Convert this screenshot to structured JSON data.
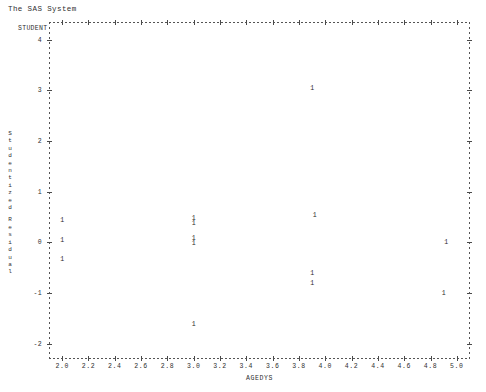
{
  "window": {
    "title": "The SAS System"
  },
  "plot": {
    "corner_label": "STUDENT",
    "point_marker": "1"
  },
  "chart_data": {
    "type": "scatter",
    "title": "The SAS System",
    "xlabel": "AGEDYS",
    "ylabel": "Studentized Residual",
    "ylabel_lines": [
      "S",
      "t",
      "u",
      "d",
      "e",
      "n",
      "t",
      "i",
      "z",
      "e",
      "d",
      "R",
      "e",
      "s",
      "i",
      "d",
      "u",
      "a",
      "l"
    ],
    "xlim": [
      1.9,
      5.1
    ],
    "ylim": [
      -2.3,
      4.35
    ],
    "xticks": [
      2.0,
      2.2,
      2.4,
      2.6,
      2.8,
      3.0,
      3.2,
      3.4,
      3.6,
      3.8,
      4.0,
      4.2,
      4.4,
      4.6,
      4.8,
      5.0
    ],
    "xticklabels": [
      "2.0",
      "2.2",
      "2.4",
      "2.6",
      "2.8",
      "3.0",
      "3.2",
      "3.4",
      "3.6",
      "3.8",
      "4.0",
      "4.2",
      "4.4",
      "4.6",
      "4.8",
      "5.0"
    ],
    "yticks": [
      4,
      3,
      2,
      1,
      0,
      -1,
      -2
    ],
    "yticklabels": [
      "4",
      "3",
      "2",
      "1",
      "0",
      "-1",
      "-2"
    ],
    "grid": false,
    "legend": null,
    "marker_label": "1",
    "points": [
      {
        "x": 2.0,
        "y": 0.42,
        "label": "1"
      },
      {
        "x": 2.0,
        "y": 0.02,
        "label": "1"
      },
      {
        "x": 2.0,
        "y": -0.34,
        "label": "1"
      },
      {
        "x": 3.0,
        "y": 0.47,
        "label": "1"
      },
      {
        "x": 3.0,
        "y": 0.36,
        "label": "1"
      },
      {
        "x": 3.0,
        "y": 0.07,
        "label": "1"
      },
      {
        "x": 3.0,
        "y": -0.04,
        "label": "1"
      },
      {
        "x": 3.0,
        "y": -1.62,
        "label": "1"
      },
      {
        "x": 3.9,
        "y": 3.02,
        "label": "1"
      },
      {
        "x": 3.92,
        "y": 0.52,
        "label": "1"
      },
      {
        "x": 3.9,
        "y": -0.62,
        "label": "1"
      },
      {
        "x": 3.9,
        "y": -0.82,
        "label": "1"
      },
      {
        "x": 4.92,
        "y": -0.02,
        "label": "1"
      },
      {
        "x": 4.9,
        "y": -1.02,
        "label": "1"
      }
    ]
  }
}
